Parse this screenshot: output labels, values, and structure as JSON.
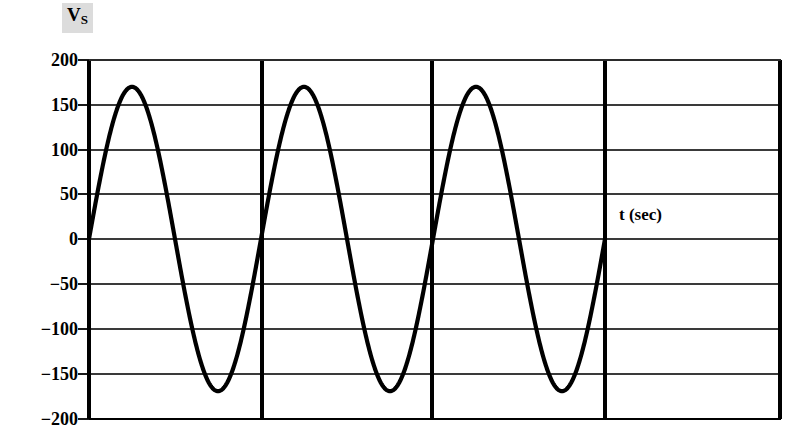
{
  "figure": {
    "background_color": "#ffffff",
    "line_color": "#000000",
    "grid_color": "#3a3a3a",
    "axis_color": "#000000",
    "highlight_color": "#dcdcdc"
  },
  "labels": {
    "y_axis_symbol_main": "V",
    "y_axis_symbol_sub": "S",
    "x_axis": "t (sec)"
  },
  "chart_data": {
    "type": "line",
    "title": "",
    "subtitle": "",
    "xlabel": "t (sec)",
    "ylabel": "Vs",
    "waveform": "sine",
    "amplitude": 170,
    "cycles": 3,
    "period_px": 172,
    "starts_at_zero_rising": true,
    "ylim": [
      -200,
      200
    ],
    "yticks": [
      200,
      150,
      100,
      50,
      0,
      -50,
      -100,
      -150,
      -200
    ],
    "ytick_labels": [
      "200",
      "150",
      "100",
      "50",
      "0",
      "−50",
      "−100",
      "−150",
      "−200"
    ],
    "xticks": [],
    "xtick_labels": [],
    "grid": true,
    "grid_horizontal": true,
    "grid_vertical": true,
    "vertical_gridline_positions_px": [
      89,
      262,
      432,
      605
    ],
    "legend": null,
    "legend_position": "none",
    "annotations": [
      {
        "text": "t (sec)",
        "x_px": 619,
        "y_px": 215
      },
      {
        "text": "Vs",
        "x_px": 67,
        "y_px": 14
      }
    ],
    "series": [
      {
        "name": "Vs",
        "description": "Three complete cycles of a sinusoid of peak amplitude 170 V starting at 0 V rising",
        "peaks": [
          170,
          170,
          170
        ],
        "troughs": [
          -170,
          -170,
          -170
        ],
        "zero_crossings_count": 7
      }
    ]
  }
}
